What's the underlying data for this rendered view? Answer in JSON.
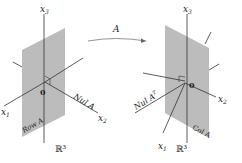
{
  "left_figure": {
    "space_label": "ℝ³",
    "axis_x1": "x",
    "axis_x1_sub": "1",
    "axis_x2": "x",
    "axis_x2_sub": "2",
    "axis_x3": "x",
    "axis_x3_sub": "3",
    "origin_label": "0",
    "line_label": "Nul A",
    "plane_label": "Row A"
  },
  "mapping_arrow": {
    "label": "A"
  },
  "right_figure": {
    "space_label": "ℝ³",
    "axis_x1": "x",
    "axis_x1_sub": "1",
    "axis_x2": "x",
    "axis_x2_sub": "2",
    "axis_x3": "x",
    "axis_x3_sub": "3",
    "origin_label": "0",
    "line_label": "Nul A",
    "line_label_sup": "T",
    "plane_label": "Col A"
  },
  "colors": {
    "plane": "#b8b8b8",
    "line": "#333333",
    "text": "#222222"
  }
}
